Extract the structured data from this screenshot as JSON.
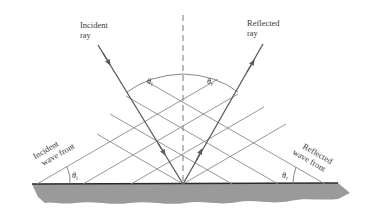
{
  "diagram": {
    "labels": {
      "incident_ray": [
        "Incident",
        "ray"
      ],
      "reflected_ray": [
        "Reflected",
        "ray"
      ],
      "incident_wave_front": [
        "Incident",
        "wave front"
      ],
      "reflected_wave_front": [
        "Reflected",
        "wave front"
      ]
    },
    "angles": {
      "incident_symbol": "θ",
      "incident_subscript": "i",
      "reflected_symbol": "θ",
      "reflected_subscript": "r"
    },
    "colors": {
      "surface_fill": "#9a9a9a",
      "surface_line": "#2a2a2a",
      "ray": "#5a5a5a",
      "wave_front": "#8a8a8a",
      "normal": "#777777",
      "text": "#3a3a3a"
    },
    "elements": {
      "normal": "dashed vertical normal line at point of incidence",
      "incident_wave_front_count": 4,
      "reflected_wave_front_count": 4
    }
  }
}
